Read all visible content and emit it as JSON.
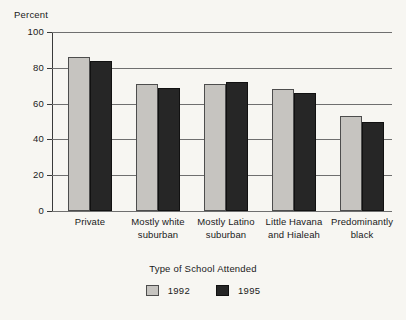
{
  "chart_data": {
    "type": "bar",
    "title": "",
    "xlabel": "Type of School Attended",
    "ylabel": "Percent",
    "ylim": [
      0,
      100
    ],
    "yticks": [
      0,
      20,
      40,
      60,
      80,
      100
    ],
    "grid": true,
    "legend_position": "bottom-center",
    "categories": [
      "Private",
      "Mostly white suburban",
      "Mostly Latino suburban",
      "Little Havana and Hialeah",
      "Predominantly black"
    ],
    "category_lines": [
      [
        "Private"
      ],
      [
        "Mostly white",
        "suburban"
      ],
      [
        "Mostly Latino",
        "suburban"
      ],
      [
        "Little Havana",
        "and Hialeah"
      ],
      [
        "Predominantly",
        "black"
      ]
    ],
    "series": [
      {
        "name": "1992",
        "color": "#c6c4c0",
        "values": [
          86,
          71,
          71,
          68,
          53
        ]
      },
      {
        "name": "1995",
        "color": "#262626",
        "values": [
          84,
          69,
          72,
          66,
          50
        ]
      }
    ]
  }
}
